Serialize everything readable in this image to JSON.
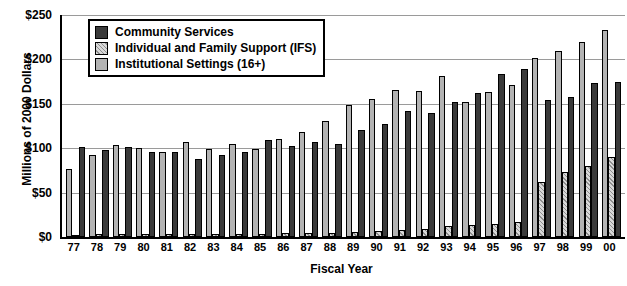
{
  "chart_data": {
    "type": "bar",
    "title": "",
    "xlabel": "Fiscal Year",
    "ylabel": "Millions of 2000 Dollars",
    "ylim": [
      0,
      250
    ],
    "ytick_labels": [
      "$0",
      "$50",
      "$100",
      "$150",
      "$200",
      "$250"
    ],
    "ytick_values": [
      0,
      50,
      100,
      150,
      200,
      250
    ],
    "grid": true,
    "legend_position": "upper-left-inside",
    "categories": [
      "77",
      "78",
      "79",
      "80",
      "81",
      "82",
      "83",
      "84",
      "85",
      "86",
      "87",
      "88",
      "89",
      "90",
      "91",
      "92",
      "93",
      "94",
      "95",
      "96",
      "97",
      "98",
      "99",
      "00"
    ],
    "series": [
      {
        "name": "Institutional Settings (16+)",
        "color": "#b3b3b3",
        "values": [
          77,
          92,
          104,
          100,
          96,
          107,
          99,
          105,
          99,
          110,
          118,
          131,
          149,
          155,
          166,
          164,
          181,
          152,
          163,
          171,
          202,
          209,
          220,
          233
        ]
      },
      {
        "name": "Individual and Family Support (IFS)",
        "color": "#d8d8d8",
        "values": [
          2,
          3,
          3,
          3,
          3,
          3,
          3,
          3,
          3,
          4,
          5,
          5,
          6,
          7,
          8,
          9,
          12,
          13,
          15,
          17,
          62,
          73,
          80,
          90
        ]
      },
      {
        "name": "Community Services",
        "color": "#3a3a3a",
        "values": [
          101,
          98,
          101,
          96,
          96,
          88,
          92,
          96,
          109,
          102,
          107,
          105,
          121,
          127,
          142,
          140,
          152,
          162,
          184,
          189,
          154,
          158,
          173,
          175
        ]
      }
    ]
  },
  "legend": {
    "items": [
      {
        "label": "Community Services",
        "key": "cs"
      },
      {
        "label": "Individual and Family Support (IFS)",
        "key": "ifs"
      },
      {
        "label": "Institutional Settings (16+)",
        "key": "inst"
      }
    ]
  }
}
